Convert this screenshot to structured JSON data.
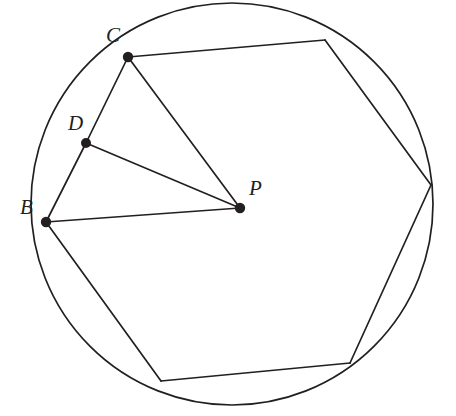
{
  "figure": {
    "width": 456,
    "height": 416,
    "background_color": "#ffffff",
    "stroke_color": "#231f20",
    "stroke_width": 1.7
  },
  "circle": {
    "name": "circumscribed-circle",
    "cx": 232,
    "cy": 204,
    "r": 201
  },
  "labels": [
    {
      "id": "C",
      "text": "C",
      "x": 106,
      "y": 25,
      "anchor_point": "C"
    },
    {
      "id": "D",
      "text": "D",
      "x": 68,
      "y": 113,
      "anchor_point": "D"
    },
    {
      "id": "B",
      "text": "B",
      "x": 20,
      "y": 197,
      "anchor_point": "B"
    },
    {
      "id": "P",
      "text": "P",
      "x": 249,
      "y": 178,
      "anchor_point": "P"
    }
  ],
  "points": [
    {
      "id": "C",
      "x": 128,
      "y": 57,
      "labeled": true,
      "dot": true,
      "dot_r": 5.2
    },
    {
      "id": "D",
      "x": 86,
      "y": 143,
      "labeled": true,
      "dot": true,
      "dot_r": 5.0
    },
    {
      "id": "B",
      "x": 46,
      "y": 222,
      "labeled": true,
      "dot": true,
      "dot_r": 5.2
    },
    {
      "id": "P",
      "x": 240,
      "y": 208,
      "labeled": true,
      "dot": true,
      "dot_r": 5.2
    },
    {
      "id": "V1",
      "x": 325,
      "y": 40,
      "labeled": false,
      "dot": false,
      "dot_r": 0
    },
    {
      "id": "V2",
      "x": 431,
      "y": 185,
      "labeled": false,
      "dot": false,
      "dot_r": 0
    },
    {
      "id": "V3",
      "x": 350,
      "y": 363,
      "labeled": false,
      "dot": false,
      "dot_r": 0
    },
    {
      "id": "V4",
      "x": 161,
      "y": 381,
      "labeled": false,
      "dot": false,
      "dot_r": 0
    }
  ],
  "polygon": {
    "name": "inscribed-heptagon",
    "vertex_order": [
      "C",
      "V1",
      "V2",
      "V3",
      "V4",
      "B",
      "D"
    ],
    "closed": true,
    "points_string": "128,57 325,40 431,185 350,363 161,381 46,222 86,143"
  },
  "segments": [
    {
      "id": "CD",
      "from": "C",
      "to": "D",
      "path": "M128,57 L86,143"
    },
    {
      "id": "CP",
      "from": "C",
      "to": "P",
      "path": "M128,57 L240,208"
    },
    {
      "id": "DP",
      "from": "D",
      "to": "P",
      "path": "M86,143 L240,208"
    },
    {
      "id": "BP",
      "from": "B",
      "to": "P",
      "path": "M46,222 L240,208"
    },
    {
      "id": "DB",
      "from": "D",
      "to": "B",
      "path": "M86,143 L46,222"
    },
    {
      "id": "CV1",
      "from": "C",
      "to": "V1",
      "path": "M128,57 L325,40"
    },
    {
      "id": "V1V2",
      "from": "V1",
      "to": "V2",
      "path": "M325,40 L431,185"
    },
    {
      "id": "V2V3",
      "from": "V2",
      "to": "V3",
      "path": "M431,185 L350,363"
    },
    {
      "id": "V3V4",
      "from": "V3",
      "to": "V4",
      "path": "M350,363 L161,381"
    },
    {
      "id": "V4B",
      "from": "V4",
      "to": "B",
      "path": "M161,381 L46,222"
    }
  ]
}
